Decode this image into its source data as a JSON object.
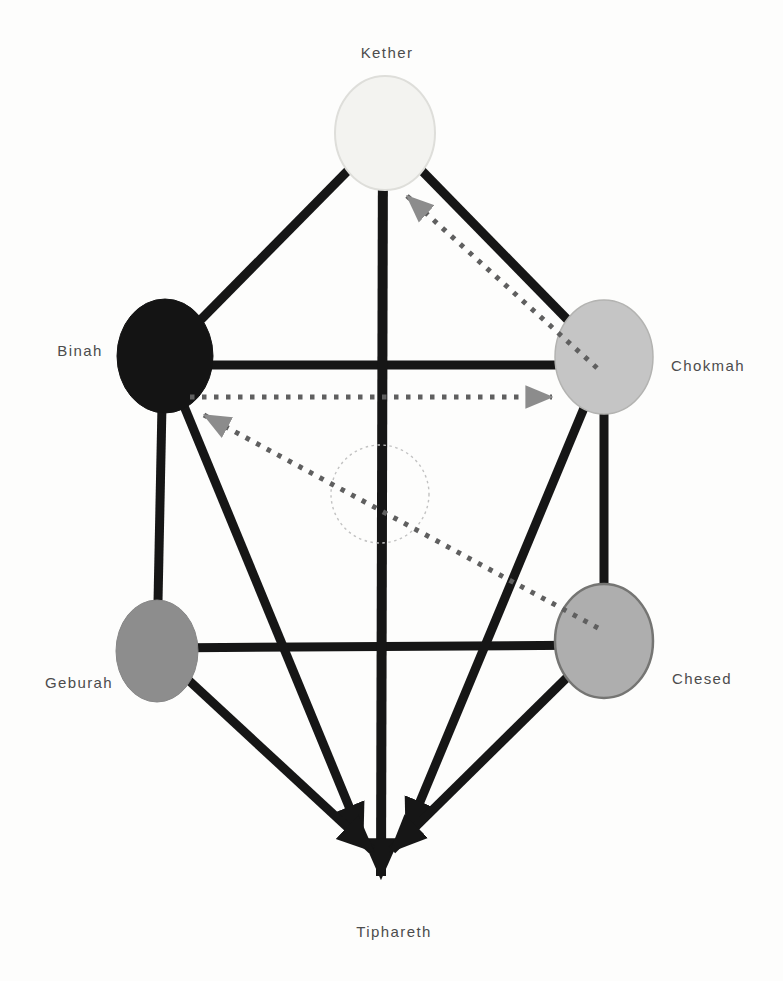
{
  "figure": {
    "description_label": "tree-of-life-diagram",
    "background_color": "#fdfdfc",
    "solid_line_color": "#161616",
    "dotted_line_color": "#5f5f5f",
    "dotted_arrowhead_color": "#8c8c8c",
    "label_color": "#4c4c4c",
    "hidden_circle_color": "#c2c2c2",
    "nodes": [
      {
        "id": "kether",
        "label": "Kether",
        "x": 385,
        "y": 133,
        "rx": 50,
        "ry": 57,
        "fill": "#f3f3f0",
        "stroke": "#dededa",
        "stroke_width": 2,
        "label_x": 387,
        "label_y": 58
      },
      {
        "id": "binah",
        "label": "Binah",
        "x": 165,
        "y": 356,
        "rx": 48,
        "ry": 57,
        "fill": "#141414",
        "stroke": "#141414",
        "stroke_width": 1,
        "label_x": 80,
        "label_y": 356
      },
      {
        "id": "chokmah",
        "label": "Chokmah",
        "x": 604,
        "y": 357,
        "rx": 49,
        "ry": 57,
        "fill": "#c5c5c5",
        "stroke": "#b3b3b1",
        "stroke_width": 1.5,
        "label_x": 708,
        "label_y": 371
      },
      {
        "id": "geburah",
        "label": "Geburah",
        "x": 157,
        "y": 651,
        "rx": 41,
        "ry": 51,
        "fill": "#8d8d8d",
        "stroke": "#868686",
        "stroke_width": 1,
        "label_x": 79,
        "label_y": 688
      },
      {
        "id": "chesed",
        "label": "Chesed",
        "x": 604,
        "y": 641,
        "rx": 49,
        "ry": 57,
        "fill": "#aeaeae",
        "stroke": "#757573",
        "stroke_width": 2.5,
        "label_x": 702,
        "label_y": 684
      },
      {
        "id": "tiphareth",
        "label": "Tiphareth",
        "x": 385,
        "y": 862,
        "rx": 0,
        "ry": 0,
        "fill": "none",
        "stroke": "none",
        "stroke_width": 0,
        "label_x": 394,
        "label_y": 937
      }
    ],
    "hidden_circle": {
      "id": "daath-hidden-circle",
      "x": 380,
      "y": 494,
      "r": 49
    },
    "solid_edges": [
      {
        "id": "kether-binah",
        "x1": 385,
        "y1": 133,
        "x2": 165,
        "y2": 356
      },
      {
        "id": "kether-chokmah",
        "x1": 385,
        "y1": 133,
        "x2": 604,
        "y2": 357
      },
      {
        "id": "binah-chokmah",
        "x1": 165,
        "y1": 365,
        "x2": 604,
        "y2": 365
      },
      {
        "id": "binah-geburah",
        "x1": 163,
        "y1": 356,
        "x2": 157,
        "y2": 651
      },
      {
        "id": "chokmah-chesed",
        "x1": 604,
        "y1": 357,
        "x2": 604,
        "y2": 641
      },
      {
        "id": "geburah-chesed",
        "x1": 157,
        "y1": 648,
        "x2": 604,
        "y2": 645
      }
    ],
    "arrow_edges": [
      {
        "id": "kether-tiphareth",
        "x1": 383,
        "y1": 140,
        "x2": 381,
        "y2": 876,
        "width": 10
      },
      {
        "id": "binah-tiphareth",
        "x1": 165,
        "y1": 360,
        "x2": 362,
        "y2": 838,
        "width": 9
      },
      {
        "id": "geburah-tiphareth",
        "x1": 157,
        "y1": 651,
        "x2": 372,
        "y2": 850,
        "width": 9
      },
      {
        "id": "chokmah-tiphareth",
        "x1": 604,
        "y1": 360,
        "x2": 407,
        "y2": 833,
        "width": 9
      },
      {
        "id": "chesed-tiphareth",
        "x1": 604,
        "y1": 641,
        "x2": 392,
        "y2": 850,
        "width": 9
      }
    ],
    "dotted_arrows": [
      {
        "id": "chokmah-kether",
        "x1": 597,
        "y1": 368,
        "x2": 407,
        "y2": 196
      },
      {
        "id": "binah-chokmah",
        "x1": 190,
        "y1": 397,
        "x2": 552,
        "y2": 397
      },
      {
        "id": "chesed-binah",
        "x1": 598,
        "y1": 628,
        "x2": 204,
        "y2": 415
      }
    ]
  }
}
